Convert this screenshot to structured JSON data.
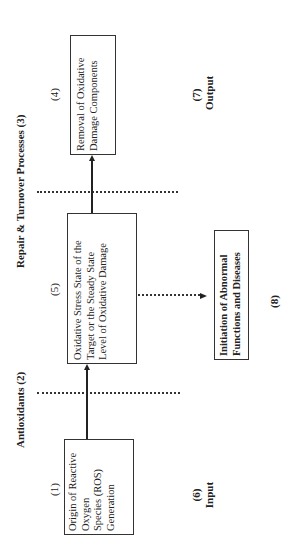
{
  "diagram": {
    "headers": {
      "antioxidants": "Antioxidants (2)",
      "repair": "Repair & Turnover Processes (3)"
    },
    "nodes": [
      {
        "id": "1",
        "number": "(1)",
        "lines": [
          "Origin of Reactive",
          "Oxygen",
          "Species (ROS)",
          "Generation"
        ]
      },
      {
        "id": "5",
        "number": "(5)",
        "lines": [
          "Oxidative Stress State of the",
          "Target or the Steady State",
          "Level of Oxidative Damage"
        ]
      },
      {
        "id": "4",
        "number": "(4)",
        "lines": [
          "Removal of Oxidative",
          "Damage Components"
        ]
      },
      {
        "id": "8",
        "number": "(8)",
        "lines": [
          "Initiation of Abnormal",
          "Functions and Diseases"
        ]
      }
    ],
    "stage_labels": {
      "input_number": "(6)",
      "input": "Input",
      "output_number": "(7)",
      "output": "Output"
    },
    "edges": [
      {
        "from": "1",
        "to": "5",
        "style": "solid"
      },
      {
        "from": "5",
        "to": "4",
        "style": "solid"
      },
      {
        "from": "5",
        "to": "8",
        "style": "dotted"
      }
    ]
  }
}
